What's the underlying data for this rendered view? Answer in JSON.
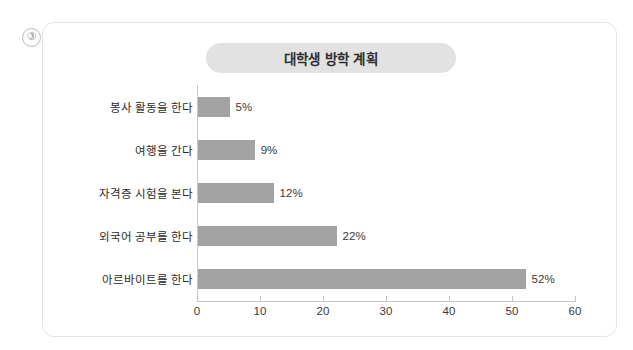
{
  "question_marker": "③",
  "card": {
    "title": "대학생 방학 계획"
  },
  "chart_data": {
    "type": "bar",
    "orientation": "horizontal",
    "title": "대학생 방학 계획",
    "xlabel": "",
    "ylabel": "",
    "categories": [
      "봉사 활동을 한다",
      "여행을 간다",
      "자격증 시험을 본다",
      "외국어 공부를 한다",
      "아르바이트를 한다"
    ],
    "values": [
      5,
      9,
      12,
      22,
      52
    ],
    "data_labels": [
      "5%",
      "9%",
      "12%",
      "22%",
      "52%"
    ],
    "xlim": [
      0,
      60
    ],
    "xticks": [
      0,
      10,
      20,
      30,
      40,
      50,
      60
    ],
    "xtick_labels": [
      "0",
      "10",
      "20",
      "30",
      "40",
      "50",
      "60"
    ],
    "grid": false,
    "legend": false,
    "bar_color": "#a3a3a3",
    "axis_color": "#c6c6c6",
    "title_background": "#e2e2e2",
    "text_color": "#2b2b2b"
  }
}
